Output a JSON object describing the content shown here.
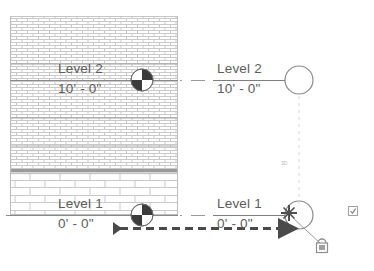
{
  "view": {
    "type": "section-view",
    "background": "#ffffff"
  },
  "levels": [
    {
      "id": "level-2",
      "name": "Level 2",
      "elevation": "10' - 0\"",
      "wall_label_x": 58,
      "wall_label_y": 63,
      "head_label_x": 217,
      "head_label_y": 63,
      "line_y": 80,
      "bubble_cx": 299,
      "bubble_cy": 80,
      "bubble_r": 14,
      "grip_cx": 142,
      "grip_cy": 80,
      "color": "#6e6e6e"
    },
    {
      "id": "level-1",
      "name": "Level 1",
      "elevation": "0' - 0\"",
      "wall_label_x": 58,
      "wall_label_y": 198,
      "head_label_x": 217,
      "head_label_y": 198,
      "line_y": 215,
      "bubble_cx": 299,
      "bubble_cy": 215,
      "bubble_r": 14,
      "grip_cx": 142,
      "grip_cy": 215,
      "color": "#6e6e6e"
    }
  ],
  "wall": {
    "x": 10,
    "y": 16,
    "width": 168,
    "height": 199,
    "upper_pattern": "running-bond-brick-fine",
    "lower_pattern": "concrete-masonry-unit",
    "band_y": 170,
    "band_height": 3,
    "band_color": "#9a9a9a",
    "line_color": "#c9c9c9",
    "fill": "#ffffff"
  },
  "annotations": {
    "drag_arrow": {
      "label": "drag-direction-arrow",
      "x1": 115,
      "y1": 228,
      "x2": 285,
      "y2": 228,
      "color": "#4a4a4a",
      "dash": "8,5",
      "width": 3
    },
    "dim_witness_line": {
      "label": "vertical-dashed-witness-line",
      "x": 299,
      "y1": 96,
      "y2": 206,
      "color": "#d8d8d8"
    },
    "dim_value": {
      "text": "3D",
      "x": 281,
      "y": 164,
      "color": "#b9b9b9"
    },
    "padlock": {
      "label": "constraint-padlock",
      "x": 321,
      "y": 243,
      "leader_x1": 300,
      "leader_y1": 219,
      "leader_x2": 322,
      "leader_y2": 244,
      "color": "#8f8f8f"
    },
    "checkbox": {
      "label": "toggle-checkbox-marker",
      "x": 348,
      "y": 206,
      "size": 9,
      "color": "#a0a0a0"
    },
    "cursor": {
      "label": "move-cursor",
      "x": 289,
      "y": 213,
      "color": "#4f4f4f"
    },
    "solid_arrow_head": {
      "label": "small-solid-pointer",
      "x": 117,
      "y": 229
    }
  },
  "grips": {
    "pinwheel_label": "level-rotation-pinwheel-grip",
    "radius": 11,
    "dark": "#3b3b3b",
    "light": "#ffffff",
    "outline": "#6e6e6e"
  },
  "colors": {
    "level_line": "#8a8a8a",
    "text": "#5d5d5d",
    "bubble_outline": "#8a8a8a",
    "hatch": "#c7c7c7",
    "accent_dark": "#3b3b3b"
  }
}
